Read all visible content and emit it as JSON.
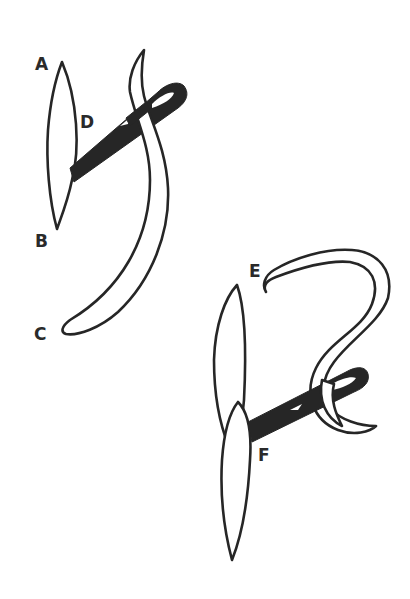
{
  "figure": {
    "panels": [
      {
        "id": "upper",
        "parts": [
          {
            "label": "A",
            "refers_to": "upper tip of tissue edge"
          },
          {
            "label": "B",
            "refers_to": "lower tip of tissue edge"
          },
          {
            "label": "C",
            "refers_to": "tail end of suture thread"
          },
          {
            "label": "D",
            "refers_to": "needle entry point"
          }
        ]
      },
      {
        "id": "lower",
        "parts": [
          {
            "label": "E",
            "refers_to": "free end of suture thread"
          },
          {
            "label": "F",
            "refers_to": "needle passage between tissue edges"
          }
        ]
      }
    ]
  },
  "labels": {
    "a": "A",
    "b": "B",
    "c": "C",
    "d": "D",
    "e": "E",
    "f": "F"
  },
  "colors": {
    "ink": "#262626",
    "background": "#ffffff"
  }
}
